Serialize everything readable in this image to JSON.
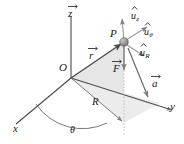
{
  "figure": {
    "background_color": "#ffffff",
    "line_color": "#4a4a4a",
    "fill_color": "#e2e2e2",
    "point_color": "#8c8c8c"
  },
  "axes": {
    "z_label": "z",
    "x_label": "x",
    "y_label": "y",
    "origin_label": "O"
  },
  "points": {
    "p_label": "P"
  },
  "vectors": {
    "r_label": "r",
    "F_label": "F",
    "a_label": "a",
    "R_label": "R"
  },
  "unit_vectors": [
    {
      "base": "u",
      "sub": "z"
    },
    {
      "base": "u",
      "sub": "θ"
    },
    {
      "base": "u",
      "sub": "R"
    }
  ],
  "angles": {
    "theta_label": "θ"
  }
}
